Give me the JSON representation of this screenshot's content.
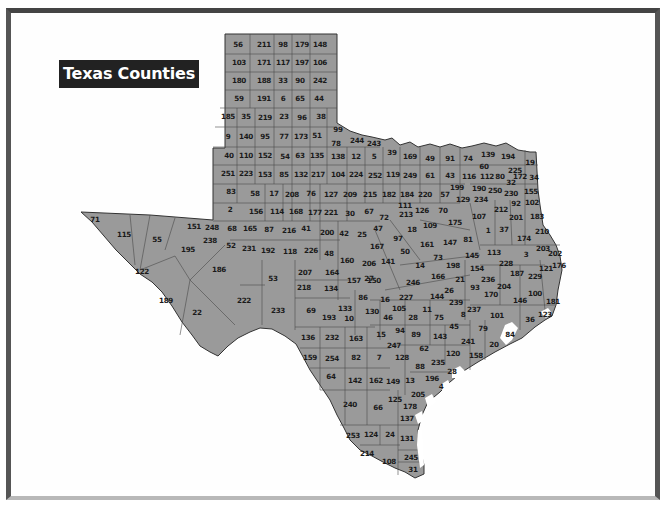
{
  "title": "Texas Counties",
  "colors": {
    "county_fill": "#9a9a9a",
    "county_border": "#4a4a4a",
    "title_bg": "#222222",
    "title_text": "#ffffff",
    "frame_dark": "#444444",
    "frame_light": "#b8b8b8",
    "water": "#ffffff"
  },
  "counties": [
    {
      "n": "56",
      "x": 238,
      "y": 45
    },
    {
      "n": "211",
      "x": 264,
      "y": 45
    },
    {
      "n": "98",
      "x": 283,
      "y": 45
    },
    {
      "n": "179",
      "x": 302,
      "y": 45
    },
    {
      "n": "148",
      "x": 320,
      "y": 45
    },
    {
      "n": "103",
      "x": 239,
      "y": 63
    },
    {
      "n": "171",
      "x": 264,
      "y": 63
    },
    {
      "n": "117",
      "x": 283,
      "y": 63
    },
    {
      "n": "197",
      "x": 302,
      "y": 63
    },
    {
      "n": "106",
      "x": 320,
      "y": 63
    },
    {
      "n": "180",
      "x": 239,
      "y": 81
    },
    {
      "n": "188",
      "x": 264,
      "y": 81
    },
    {
      "n": "33",
      "x": 283,
      "y": 81
    },
    {
      "n": "90",
      "x": 300,
      "y": 81
    },
    {
      "n": "242",
      "x": 320,
      "y": 81
    },
    {
      "n": "59",
      "x": 239,
      "y": 99
    },
    {
      "n": "191",
      "x": 264,
      "y": 99
    },
    {
      "n": "6",
      "x": 283,
      "y": 99
    },
    {
      "n": "65",
      "x": 300,
      "y": 99
    },
    {
      "n": "44",
      "x": 319,
      "y": 99
    },
    {
      "n": "185",
      "x": 228,
      "y": 117
    },
    {
      "n": "35",
      "x": 246,
      "y": 117
    },
    {
      "n": "219",
      "x": 265,
      "y": 118
    },
    {
      "n": "23",
      "x": 284,
      "y": 117
    },
    {
      "n": "96",
      "x": 302,
      "y": 118
    },
    {
      "n": "38",
      "x": 321,
      "y": 117
    },
    {
      "n": "9",
      "x": 228,
      "y": 137
    },
    {
      "n": "140",
      "x": 246,
      "y": 137
    },
    {
      "n": "95",
      "x": 265,
      "y": 137
    },
    {
      "n": "77",
      "x": 284,
      "y": 137
    },
    {
      "n": "173",
      "x": 301,
      "y": 137
    },
    {
      "n": "51",
      "x": 317,
      "y": 136
    },
    {
      "n": "99",
      "x": 338,
      "y": 130
    },
    {
      "n": "78",
      "x": 336,
      "y": 144
    },
    {
      "n": "244",
      "x": 357,
      "y": 141
    },
    {
      "n": "243",
      "x": 374,
      "y": 144
    },
    {
      "n": "40",
      "x": 229,
      "y": 156
    },
    {
      "n": "110",
      "x": 246,
      "y": 156
    },
    {
      "n": "152",
      "x": 265,
      "y": 156
    },
    {
      "n": "54",
      "x": 285,
      "y": 157
    },
    {
      "n": "63",
      "x": 300,
      "y": 156
    },
    {
      "n": "135",
      "x": 317,
      "y": 156
    },
    {
      "n": "138",
      "x": 338,
      "y": 157
    },
    {
      "n": "12",
      "x": 356,
      "y": 157
    },
    {
      "n": "5",
      "x": 374,
      "y": 157
    },
    {
      "n": "39",
      "x": 392,
      "y": 153
    },
    {
      "n": "169",
      "x": 410,
      "y": 157
    },
    {
      "n": "49",
      "x": 430,
      "y": 159
    },
    {
      "n": "91",
      "x": 450,
      "y": 159
    },
    {
      "n": "74",
      "x": 468,
      "y": 159
    },
    {
      "n": "139",
      "x": 488,
      "y": 155
    },
    {
      "n": "194",
      "x": 508,
      "y": 157
    },
    {
      "n": "19",
      "x": 530,
      "y": 163
    },
    {
      "n": "60",
      "x": 484,
      "y": 167
    },
    {
      "n": "225",
      "x": 515,
      "y": 171
    },
    {
      "n": "80",
      "x": 500,
      "y": 177
    },
    {
      "n": "172",
      "x": 520,
      "y": 177
    },
    {
      "n": "34",
      "x": 534,
      "y": 178
    },
    {
      "n": "112",
      "x": 487,
      "y": 177
    },
    {
      "n": "32",
      "x": 511,
      "y": 183
    },
    {
      "n": "251",
      "x": 228,
      "y": 174
    },
    {
      "n": "223",
      "x": 246,
      "y": 174
    },
    {
      "n": "153",
      "x": 265,
      "y": 175
    },
    {
      "n": "85",
      "x": 284,
      "y": 175
    },
    {
      "n": "132",
      "x": 301,
      "y": 175
    },
    {
      "n": "217",
      "x": 318,
      "y": 175
    },
    {
      "n": "104",
      "x": 338,
      "y": 175
    },
    {
      "n": "224",
      "x": 356,
      "y": 175
    },
    {
      "n": "252",
      "x": 375,
      "y": 176
    },
    {
      "n": "119",
      "x": 393,
      "y": 175
    },
    {
      "n": "249",
      "x": 410,
      "y": 176
    },
    {
      "n": "61",
      "x": 430,
      "y": 176
    },
    {
      "n": "43",
      "x": 450,
      "y": 176
    },
    {
      "n": "116",
      "x": 469,
      "y": 177
    },
    {
      "n": "155",
      "x": 531,
      "y": 192
    },
    {
      "n": "230",
      "x": 511,
      "y": 194
    },
    {
      "n": "250",
      "x": 495,
      "y": 191
    },
    {
      "n": "190",
      "x": 479,
      "y": 189
    },
    {
      "n": "199",
      "x": 457,
      "y": 188
    },
    {
      "n": "83",
      "x": 231,
      "y": 192
    },
    {
      "n": "58",
      "x": 255,
      "y": 194
    },
    {
      "n": "17",
      "x": 274,
      "y": 194
    },
    {
      "n": "208",
      "x": 292,
      "y": 195
    },
    {
      "n": "76",
      "x": 311,
      "y": 194
    },
    {
      "n": "127",
      "x": 331,
      "y": 195
    },
    {
      "n": "209",
      "x": 350,
      "y": 195
    },
    {
      "n": "215",
      "x": 370,
      "y": 195
    },
    {
      "n": "182",
      "x": 389,
      "y": 195
    },
    {
      "n": "184",
      "x": 407,
      "y": 195
    },
    {
      "n": "220",
      "x": 425,
      "y": 195
    },
    {
      "n": "57",
      "x": 445,
      "y": 195
    },
    {
      "n": "92",
      "x": 516,
      "y": 204
    },
    {
      "n": "102",
      "x": 532,
      "y": 203
    },
    {
      "n": "129",
      "x": 463,
      "y": 200
    },
    {
      "n": "234",
      "x": 481,
      "y": 200
    },
    {
      "n": "212",
      "x": 501,
      "y": 210
    },
    {
      "n": "2",
      "x": 230,
      "y": 210
    },
    {
      "n": "156",
      "x": 256,
      "y": 212
    },
    {
      "n": "114",
      "x": 277,
      "y": 212
    },
    {
      "n": "168",
      "x": 296,
      "y": 212
    },
    {
      "n": "177",
      "x": 315,
      "y": 213
    },
    {
      "n": "221",
      "x": 331,
      "y": 213
    },
    {
      "n": "30",
      "x": 350,
      "y": 214
    },
    {
      "n": "67",
      "x": 369,
      "y": 212
    },
    {
      "n": "111",
      "x": 405,
      "y": 206
    },
    {
      "n": "213",
      "x": 406,
      "y": 215
    },
    {
      "n": "126",
      "x": 422,
      "y": 211
    },
    {
      "n": "70",
      "x": 443,
      "y": 211
    },
    {
      "n": "72",
      "x": 384,
      "y": 218
    },
    {
      "n": "175",
      "x": 455,
      "y": 223
    },
    {
      "n": "107",
      "x": 479,
      "y": 217
    },
    {
      "n": "201",
      "x": 516,
      "y": 218
    },
    {
      "n": "183",
      "x": 537,
      "y": 217
    },
    {
      "n": "71",
      "x": 95,
      "y": 220
    },
    {
      "n": "151",
      "x": 194,
      "y": 227
    },
    {
      "n": "248",
      "x": 212,
      "y": 228
    },
    {
      "n": "68",
      "x": 232,
      "y": 229
    },
    {
      "n": "165",
      "x": 250,
      "y": 229
    },
    {
      "n": "87",
      "x": 269,
      "y": 230
    },
    {
      "n": "216",
      "x": 289,
      "y": 231
    },
    {
      "n": "41",
      "x": 306,
      "y": 229
    },
    {
      "n": "200",
      "x": 327,
      "y": 233
    },
    {
      "n": "42",
      "x": 344,
      "y": 234
    },
    {
      "n": "25",
      "x": 362,
      "y": 235
    },
    {
      "n": "47",
      "x": 378,
      "y": 229
    },
    {
      "n": "18",
      "x": 412,
      "y": 230
    },
    {
      "n": "109",
      "x": 430,
      "y": 226
    },
    {
      "n": "1",
      "x": 488,
      "y": 231
    },
    {
      "n": "37",
      "x": 504,
      "y": 230
    },
    {
      "n": "174",
      "x": 524,
      "y": 239
    },
    {
      "n": "210",
      "x": 542,
      "y": 232
    },
    {
      "n": "115",
      "x": 124,
      "y": 235
    },
    {
      "n": "55",
      "x": 157,
      "y": 240
    },
    {
      "n": "238",
      "x": 210,
      "y": 241
    },
    {
      "n": "195",
      "x": 188,
      "y": 250
    },
    {
      "n": "52",
      "x": 231,
      "y": 246
    },
    {
      "n": "231",
      "x": 249,
      "y": 249
    },
    {
      "n": "192",
      "x": 268,
      "y": 251
    },
    {
      "n": "118",
      "x": 290,
      "y": 252
    },
    {
      "n": "226",
      "x": 311,
      "y": 251
    },
    {
      "n": "48",
      "x": 329,
      "y": 254
    },
    {
      "n": "97",
      "x": 398,
      "y": 239
    },
    {
      "n": "167",
      "x": 377,
      "y": 247
    },
    {
      "n": "161",
      "x": 427,
      "y": 245
    },
    {
      "n": "147",
      "x": 450,
      "y": 243
    },
    {
      "n": "81",
      "x": 468,
      "y": 240
    },
    {
      "n": "50",
      "x": 405,
      "y": 252
    },
    {
      "n": "203",
      "x": 543,
      "y": 249
    },
    {
      "n": "202",
      "x": 555,
      "y": 254
    },
    {
      "n": "3",
      "x": 526,
      "y": 255
    },
    {
      "n": "113",
      "x": 494,
      "y": 253
    },
    {
      "n": "145",
      "x": 472,
      "y": 256
    },
    {
      "n": "73",
      "x": 438,
      "y": 258
    },
    {
      "n": "160",
      "x": 347,
      "y": 261
    },
    {
      "n": "206",
      "x": 369,
      "y": 264
    },
    {
      "n": "141",
      "x": 388,
      "y": 262
    },
    {
      "n": "176",
      "x": 559,
      "y": 266
    },
    {
      "n": "121",
      "x": 546,
      "y": 269
    },
    {
      "n": "122",
      "x": 142,
      "y": 272
    },
    {
      "n": "186",
      "x": 219,
      "y": 270
    },
    {
      "n": "53",
      "x": 273,
      "y": 279
    },
    {
      "n": "207",
      "x": 305,
      "y": 273
    },
    {
      "n": "164",
      "x": 332,
      "y": 273
    },
    {
      "n": "14",
      "x": 420,
      "y": 266
    },
    {
      "n": "198",
      "x": 453,
      "y": 266
    },
    {
      "n": "228",
      "x": 506,
      "y": 264
    },
    {
      "n": "154",
      "x": 477,
      "y": 269
    },
    {
      "n": "27",
      "x": 369,
      "y": 279
    },
    {
      "n": "246",
      "x": 413,
      "y": 283
    },
    {
      "n": "166",
      "x": 438,
      "y": 277
    },
    {
      "n": "187",
      "x": 517,
      "y": 274
    },
    {
      "n": "229",
      "x": 535,
      "y": 277
    },
    {
      "n": "21",
      "x": 460,
      "y": 280
    },
    {
      "n": "236",
      "x": 488,
      "y": 280
    },
    {
      "n": "93",
      "x": 475,
      "y": 288
    },
    {
      "n": "204",
      "x": 504,
      "y": 287
    },
    {
      "n": "157",
      "x": 354,
      "y": 281
    },
    {
      "n": "150",
      "x": 374,
      "y": 281
    },
    {
      "n": "218",
      "x": 304,
      "y": 288
    },
    {
      "n": "134",
      "x": 331,
      "y": 289
    },
    {
      "n": "26",
      "x": 449,
      "y": 291
    },
    {
      "n": "170",
      "x": 491,
      "y": 295
    },
    {
      "n": "100",
      "x": 535,
      "y": 294
    },
    {
      "n": "189",
      "x": 166,
      "y": 301
    },
    {
      "n": "22",
      "x": 197,
      "y": 313
    },
    {
      "n": "86",
      "x": 363,
      "y": 298
    },
    {
      "n": "16",
      "x": 385,
      "y": 300
    },
    {
      "n": "227",
      "x": 406,
      "y": 298
    },
    {
      "n": "144",
      "x": 437,
      "y": 297
    },
    {
      "n": "239",
      "x": 456,
      "y": 303
    },
    {
      "n": "146",
      "x": 520,
      "y": 301
    },
    {
      "n": "181",
      "x": 553,
      "y": 302
    },
    {
      "n": "222",
      "x": 244,
      "y": 301
    },
    {
      "n": "233",
      "x": 278,
      "y": 311
    },
    {
      "n": "69",
      "x": 311,
      "y": 311
    },
    {
      "n": "133",
      "x": 345,
      "y": 309
    },
    {
      "n": "130",
      "x": 372,
      "y": 312
    },
    {
      "n": "105",
      "x": 399,
      "y": 309
    },
    {
      "n": "11",
      "x": 427,
      "y": 310
    },
    {
      "n": "237",
      "x": 474,
      "y": 310
    },
    {
      "n": "101",
      "x": 497,
      "y": 316
    },
    {
      "n": "123",
      "x": 545,
      "y": 315
    },
    {
      "n": "193",
      "x": 329,
      "y": 318
    },
    {
      "n": "10",
      "x": 349,
      "y": 319
    },
    {
      "n": "46",
      "x": 388,
      "y": 318
    },
    {
      "n": "28",
      "x": 413,
      "y": 318
    },
    {
      "n": "8",
      "x": 463,
      "y": 315
    },
    {
      "n": "36",
      "x": 530,
      "y": 320
    },
    {
      "n": "75",
      "x": 439,
      "y": 318
    },
    {
      "n": "45",
      "x": 454,
      "y": 327
    },
    {
      "n": "79",
      "x": 483,
      "y": 329
    },
    {
      "n": "84",
      "x": 510,
      "y": 335
    },
    {
      "n": "94",
      "x": 400,
      "y": 331
    },
    {
      "n": "89",
      "x": 416,
      "y": 335
    },
    {
      "n": "143",
      "x": 440,
      "y": 337
    },
    {
      "n": "136",
      "x": 308,
      "y": 338
    },
    {
      "n": "232",
      "x": 332,
      "y": 338
    },
    {
      "n": "163",
      "x": 356,
      "y": 339
    },
    {
      "n": "15",
      "x": 381,
      "y": 335
    },
    {
      "n": "241",
      "x": 468,
      "y": 342
    },
    {
      "n": "20",
      "x": 494,
      "y": 345
    },
    {
      "n": "247",
      "x": 394,
      "y": 346
    },
    {
      "n": "62",
      "x": 424,
      "y": 349
    },
    {
      "n": "120",
      "x": 453,
      "y": 354
    },
    {
      "n": "158",
      "x": 476,
      "y": 356
    },
    {
      "n": "159",
      "x": 310,
      "y": 358
    },
    {
      "n": "254",
      "x": 332,
      "y": 359
    },
    {
      "n": "82",
      "x": 356,
      "y": 358
    },
    {
      "n": "7",
      "x": 379,
      "y": 358
    },
    {
      "n": "128",
      "x": 402,
      "y": 358
    },
    {
      "n": "88",
      "x": 420,
      "y": 367
    },
    {
      "n": "235",
      "x": 438,
      "y": 363
    },
    {
      "n": "28b",
      "label": "28",
      "x": 452,
      "y": 372
    },
    {
      "n": "64",
      "x": 331,
      "y": 377
    },
    {
      "n": "142",
      "x": 355,
      "y": 381
    },
    {
      "n": "162",
      "x": 376,
      "y": 381
    },
    {
      "n": "149",
      "x": 393,
      "y": 382
    },
    {
      "n": "13",
      "x": 410,
      "y": 381
    },
    {
      "n": "196",
      "x": 432,
      "y": 379
    },
    {
      "n": "4",
      "x": 441,
      "y": 387
    },
    {
      "n": "205",
      "x": 418,
      "y": 395
    },
    {
      "n": "125",
      "x": 395,
      "y": 400
    },
    {
      "n": "240",
      "x": 350,
      "y": 405
    },
    {
      "n": "66",
      "x": 378,
      "y": 408
    },
    {
      "n": "178",
      "x": 410,
      "y": 407
    },
    {
      "n": "137",
      "x": 407,
      "y": 419
    },
    {
      "n": "253",
      "x": 353,
      "y": 436
    },
    {
      "n": "124",
      "x": 371,
      "y": 435
    },
    {
      "n": "24",
      "x": 390,
      "y": 435
    },
    {
      "n": "131",
      "x": 407,
      "y": 439
    },
    {
      "n": "214",
      "x": 367,
      "y": 454
    },
    {
      "n": "108",
      "x": 389,
      "y": 462
    },
    {
      "n": "245",
      "x": 411,
      "y": 458
    },
    {
      "n": "31",
      "x": 413,
      "y": 470
    }
  ]
}
